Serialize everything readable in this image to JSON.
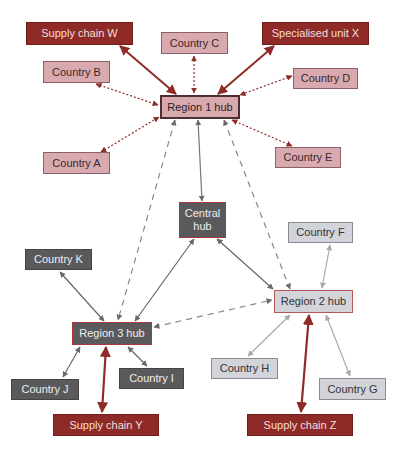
{
  "diagram": {
    "nodes": {
      "supply_chain_w": {
        "label": "Supply chain W",
        "color": "#8e2b26"
      },
      "country_c": {
        "label": "Country C",
        "color": "#d9a9b0"
      },
      "specialised_unit_x": {
        "label": "Specialised unit X",
        "color": "#8e2b26"
      },
      "country_b": {
        "label": "Country B",
        "color": "#d9a9b0"
      },
      "country_d": {
        "label": "Country D",
        "color": "#d9a9b0"
      },
      "region_1_hub": {
        "label": "Region 1 hub",
        "color": "#d9a9b0"
      },
      "country_a": {
        "label": "Country A",
        "color": "#d9a9b0"
      },
      "country_e": {
        "label": "Country E",
        "color": "#d9a9b0"
      },
      "central_hub": {
        "label": "Central hub",
        "color": "#5a5a5c"
      },
      "country_f": {
        "label": "Country F",
        "color": "#d2d4da"
      },
      "country_k": {
        "label": "Country K",
        "color": "#5a5a5c"
      },
      "region_2_hub": {
        "label": "Region 2 hub",
        "color": "#d2d4da"
      },
      "region_3_hub": {
        "label": "Region 3 hub",
        "color": "#5a5a5c"
      },
      "country_j": {
        "label": "Country J",
        "color": "#5a5a5c"
      },
      "country_i": {
        "label": "Country I",
        "color": "#5a5a5c"
      },
      "country_h": {
        "label": "Country H",
        "color": "#d2d4da"
      },
      "country_g": {
        "label": "Country G",
        "color": "#d2d4da"
      },
      "supply_chain_y": {
        "label": "Supply chain Y",
        "color": "#8e2b26"
      },
      "supply_chain_z": {
        "label": "Supply chain Z",
        "color": "#8e2b26"
      }
    },
    "edges": [
      {
        "from": "Supply chain W",
        "to": "Region 1 hub",
        "style": "solid-thick",
        "color": "#8e2b26"
      },
      {
        "from": "Specialised unit X",
        "to": "Region 1 hub",
        "style": "solid-thick",
        "color": "#8e2b26"
      },
      {
        "from": "Country C",
        "to": "Region 1 hub",
        "style": "dotted",
        "color": "#8e2b26"
      },
      {
        "from": "Country B",
        "to": "Region 1 hub",
        "style": "dotted",
        "color": "#8e2b26"
      },
      {
        "from": "Country D",
        "to": "Region 1 hub",
        "style": "dotted",
        "color": "#8e2b26"
      },
      {
        "from": "Country A",
        "to": "Region 1 hub",
        "style": "dotted",
        "color": "#8e2b26"
      },
      {
        "from": "Country E",
        "to": "Region 1 hub",
        "style": "dotted",
        "color": "#8e2b26"
      },
      {
        "from": "Region 1 hub",
        "to": "Central hub",
        "style": "solid",
        "color": "#777777"
      },
      {
        "from": "Region 1 hub",
        "to": "Region 3 hub",
        "style": "dashed",
        "color": "#888888"
      },
      {
        "from": "Region 1 hub",
        "to": "Region 2 hub",
        "style": "dashed",
        "color": "#888888"
      },
      {
        "from": "Central hub",
        "to": "Region 3 hub",
        "style": "solid",
        "color": "#666666"
      },
      {
        "from": "Central hub",
        "to": "Region 2 hub",
        "style": "solid",
        "color": "#666666"
      },
      {
        "from": "Region 3 hub",
        "to": "Region 2 hub",
        "style": "dashed",
        "color": "#888888"
      },
      {
        "from": "Country K",
        "to": "Region 3 hub",
        "style": "solid",
        "color": "#666666"
      },
      {
        "from": "Country J",
        "to": "Region 3 hub",
        "style": "solid",
        "color": "#666666"
      },
      {
        "from": "Country I",
        "to": "Region 3 hub",
        "style": "solid",
        "color": "#666666"
      },
      {
        "from": "Supply chain Y",
        "to": "Region 3 hub",
        "style": "solid-thick",
        "color": "#8e2b26"
      },
      {
        "from": "Country F",
        "to": "Region 2 hub",
        "style": "solid",
        "color": "#aaaaaa"
      },
      {
        "from": "Country H",
        "to": "Region 2 hub",
        "style": "solid",
        "color": "#aaaaaa"
      },
      {
        "from": "Country G",
        "to": "Region 2 hub",
        "style": "solid",
        "color": "#aaaaaa"
      },
      {
        "from": "Supply chain Z",
        "to": "Region 2 hub",
        "style": "solid-thick",
        "color": "#8e2b26"
      }
    ]
  }
}
